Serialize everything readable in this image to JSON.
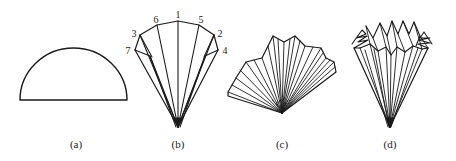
{
  "figure": {
    "panels": [
      {
        "id": "a",
        "label": "(a)",
        "shape": "semicircle",
        "label_x": 76
      },
      {
        "id": "b",
        "label": "(b)",
        "shape": "folded-cone-with-numbered-points",
        "label_x": 178
      },
      {
        "id": "c",
        "label": "(c)",
        "shape": "pleated-fan",
        "label_x": 282
      },
      {
        "id": "d",
        "label": "(d)",
        "shape": "pleated-cup-crown",
        "label_x": 390
      }
    ],
    "panel_b_points": [
      {
        "n": "1",
        "x": 178,
        "y": 14
      },
      {
        "n": "6",
        "x": 156,
        "y": 19
      },
      {
        "n": "5",
        "x": 201,
        "y": 19
      },
      {
        "n": "3",
        "x": 134,
        "y": 33
      },
      {
        "n": "2",
        "x": 220,
        "y": 33
      },
      {
        "n": "7",
        "x": 128,
        "y": 50
      },
      {
        "n": "4",
        "x": 224,
        "y": 50
      }
    ],
    "colors": {
      "stroke": "#1a1a1a",
      "background": "#ffffff",
      "text": "#222222"
    }
  }
}
